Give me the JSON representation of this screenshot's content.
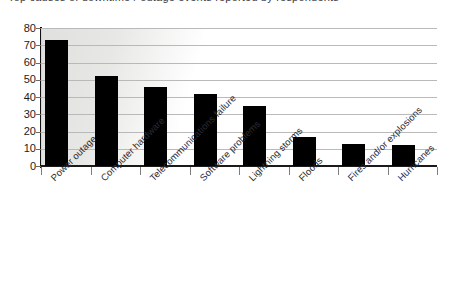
{
  "page": {
    "clipped_heading": "Top causes of downtime / outage events reported by respondents"
  },
  "chart_data": {
    "type": "bar",
    "title": "",
    "xlabel": "",
    "ylabel": "",
    "ylim": [
      0,
      80
    ],
    "ytick_step": 10,
    "yticks": [
      80,
      70,
      60,
      50,
      40,
      30,
      20,
      10,
      0
    ],
    "grid": true,
    "legend": null,
    "orientation": "vertical",
    "bar_color": "#000000",
    "categories": [
      "Power outage",
      "Computer hardware",
      "Telecommunications failure",
      "Software problems",
      "Lightning storms",
      "Floods",
      "Fires and/or explosions",
      "Hurricanes"
    ],
    "values": [
      73,
      52,
      46,
      42,
      35,
      17,
      13,
      12
    ]
  },
  "style": {
    "axis_color": "#121212",
    "grid_color": "#b9b9b9",
    "text_color": "#1b1b1b",
    "background": "#ffffff"
  }
}
